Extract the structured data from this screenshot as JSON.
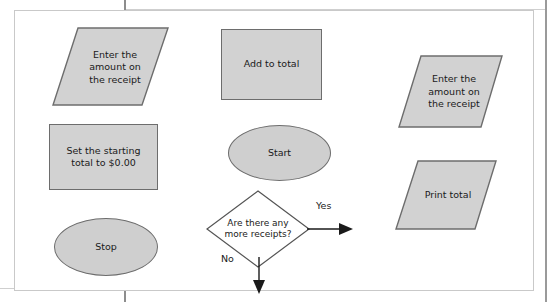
{
  "figure": {
    "type": "flowchart",
    "title": "",
    "background": "#ffffff",
    "frame_border_color": "#c9c9c9",
    "shape_fill": "#d2d2d2",
    "shape_stroke": "#6d6d6d",
    "decision_fill": "#ffffff",
    "text_color": "#1a1a1a",
    "nodes": [
      {
        "id": "enter-amount-left",
        "shape": "parallelogram",
        "role": "input-output",
        "label": "Enter the\namount on\nthe receipt"
      },
      {
        "id": "add-to-total",
        "shape": "rectangle",
        "role": "process",
        "label": "Add to total"
      },
      {
        "id": "enter-amount-right",
        "shape": "parallelogram",
        "role": "input-output",
        "label": "Enter the\namount on\nthe receipt"
      },
      {
        "id": "set-starting-total",
        "shape": "rectangle",
        "role": "process",
        "label": "Set the starting\ntotal to $0.00"
      },
      {
        "id": "start",
        "shape": "ellipse",
        "role": "terminator",
        "label": "Start"
      },
      {
        "id": "print-total",
        "shape": "parallelogram",
        "role": "input-output",
        "label": "Print total"
      },
      {
        "id": "stop",
        "shape": "ellipse",
        "role": "terminator",
        "label": "Stop"
      },
      {
        "id": "more-receipts",
        "shape": "diamond",
        "role": "decision",
        "label": "Are there any\nmore receipts?"
      }
    ],
    "connectors": [
      {
        "id": "yes-branch",
        "from": "more-receipts",
        "direction": "right",
        "label": "Yes"
      },
      {
        "id": "no-branch",
        "from": "more-receipts",
        "direction": "down",
        "label": "No"
      }
    ]
  }
}
